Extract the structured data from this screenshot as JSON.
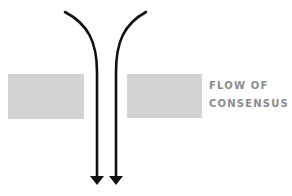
{
  "diagram": {
    "label": {
      "line1": "FLOW OF",
      "line2": "CONSENSUS"
    },
    "elements": {
      "blocks": [
        {
          "name": "left-barrier",
          "color": "#d3d3d3"
        },
        {
          "name": "right-barrier",
          "color": "#d3d3d3"
        }
      ],
      "arrows": [
        {
          "name": "left-flow-arrow",
          "direction": "down",
          "color": "#111111"
        },
        {
          "name": "right-flow-arrow",
          "direction": "down",
          "color": "#111111"
        }
      ]
    },
    "colors": {
      "block": "#d3d3d3",
      "arrow": "#111111",
      "label": "#8c8c8c",
      "background": "#ffffff"
    }
  }
}
